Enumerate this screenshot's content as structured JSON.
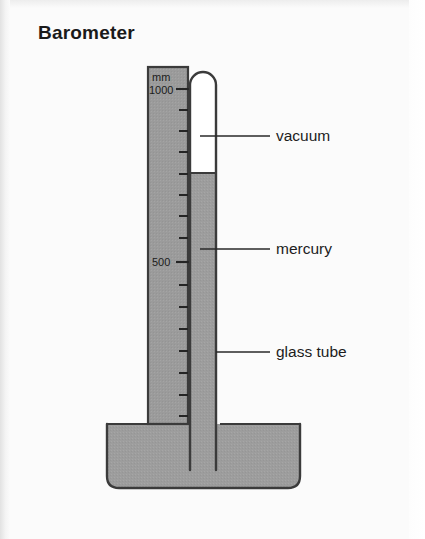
{
  "page": {
    "title": "Barometer",
    "background_color": "#fbfbfb",
    "width": 425,
    "height": 539
  },
  "diagram": {
    "type": "barometer-schematic",
    "colors": {
      "mercury": "#9d9d9d",
      "vacuum": "#ffffff",
      "outline": "#3b3b3b",
      "scale_plate": "#9d9d9d",
      "text": "#1d1d1d"
    },
    "scale": {
      "unit_label": "mm",
      "ticks": [
        {
          "value": "1000",
          "labeled": true
        },
        {
          "value": "",
          "labeled": false
        },
        {
          "value": "",
          "labeled": false
        },
        {
          "value": "",
          "labeled": false
        },
        {
          "value": "",
          "labeled": false
        },
        {
          "value": "",
          "labeled": false
        },
        {
          "value": "",
          "labeled": false
        },
        {
          "value": "",
          "labeled": false
        },
        {
          "value": "500",
          "labeled": true
        },
        {
          "value": "",
          "labeled": false
        },
        {
          "value": "",
          "labeled": false
        },
        {
          "value": "",
          "labeled": false
        },
        {
          "value": "",
          "labeled": false
        },
        {
          "value": "",
          "labeled": false
        },
        {
          "value": "",
          "labeled": false
        },
        {
          "value": "",
          "labeled": false
        }
      ],
      "major_labels": [
        "1000",
        "500"
      ]
    },
    "callouts": [
      {
        "id": "vacuum",
        "label": "vacuum",
        "points_at": "space above mercury column inside sealed tube"
      },
      {
        "id": "mercury",
        "label": "mercury",
        "points_at": "mercury column inside the tube"
      },
      {
        "id": "glass-tube",
        "label": "glass tube",
        "points_at": "wall of the glass tube"
      }
    ],
    "parts": {
      "tube_label": "glass tube",
      "column_label": "mercury",
      "head_label": "vacuum",
      "reservoir_label": "mercury"
    }
  }
}
